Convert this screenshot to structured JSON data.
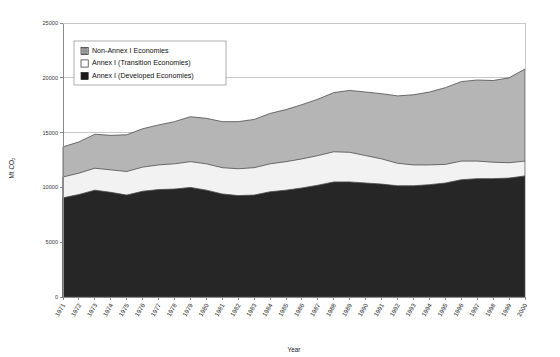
{
  "chart_data": {
    "type": "area",
    "stacked": true,
    "title": "",
    "xlabel": "Year",
    "ylabel": "Mt CO2",
    "ylabel_display": "Mt CO₂",
    "ylim": [
      0,
      25000
    ],
    "ytick_step": 5000,
    "yticks": [
      0,
      5000,
      10000,
      15000,
      20000,
      25000
    ],
    "ytick_labels": [
      "0",
      "5000",
      "10000",
      "15000",
      "20000",
      "25000"
    ],
    "grid": true,
    "grid_axis": "y",
    "legend_position": "top-left-inside",
    "x": [
      "1971",
      "1972",
      "1973",
      "1974",
      "1975",
      "1976",
      "1977",
      "1978",
      "1979",
      "1980",
      "1981",
      "1982",
      "1983",
      "1984",
      "1985",
      "1986",
      "1987",
      "1988",
      "1989",
      "1990",
      "1991",
      "1992",
      "1993",
      "1994",
      "1995",
      "1996",
      "1997",
      "1998",
      "1999",
      "2000"
    ],
    "categories": [
      "1971",
      "1972",
      "1973",
      "1974",
      "1975",
      "1976",
      "1977",
      "1978",
      "1979",
      "1980",
      "1981",
      "1982",
      "1983",
      "1984",
      "1985",
      "1986",
      "1987",
      "1988",
      "1989",
      "1990",
      "1991",
      "1992",
      "1993",
      "1994",
      "1995",
      "1996",
      "1997",
      "1998",
      "1999",
      "2000"
    ],
    "series": [
      {
        "name": "Annex I (Developed Economies)",
        "legend_label": "Annex I (Developed Economies)",
        "color": "#262626",
        "swatch": "black-square",
        "stack_order": 1,
        "values": [
          9050,
          9350,
          9750,
          9550,
          9300,
          9650,
          9800,
          9850,
          10000,
          9750,
          9400,
          9250,
          9300,
          9600,
          9750,
          9950,
          10200,
          10500,
          10500,
          10400,
          10300,
          10150,
          10150,
          10250,
          10400,
          10700,
          10800,
          10800,
          10850,
          11050
        ]
      },
      {
        "name": "Annex I (Transition Economies)",
        "legend_label": "Annex I (Transition Economies)",
        "color": "#f2f2f2",
        "swatch": "white-square",
        "stack_order": 2,
        "values": [
          1900,
          1950,
          2000,
          2050,
          2150,
          2200,
          2250,
          2300,
          2350,
          2400,
          2400,
          2450,
          2500,
          2550,
          2600,
          2650,
          2700,
          2750,
          2700,
          2500,
          2300,
          2050,
          1900,
          1800,
          1700,
          1700,
          1600,
          1500,
          1400,
          1350
        ]
      },
      {
        "name": "Non-Annex I Economies",
        "legend_label": "Non-Annex I Economies",
        "color": "#b5b5b5",
        "swatch": "gray-patterned-square",
        "stack_order": 3,
        "values": [
          2750,
          2850,
          3100,
          3150,
          3350,
          3500,
          3650,
          3850,
          4100,
          4150,
          4200,
          4300,
          4400,
          4600,
          4750,
          4950,
          5150,
          5400,
          5650,
          5800,
          5950,
          6150,
          6400,
          6650,
          7000,
          7250,
          7400,
          7450,
          7750,
          8400
        ]
      }
    ],
    "stack_totals": [
      13700,
      14150,
      14850,
      14750,
      14800,
      15350,
      15700,
      16000,
      16450,
      16300,
      16000,
      16000,
      16200,
      16750,
      17100,
      17550,
      18050,
      18650,
      18850,
      18700,
      18550,
      18350,
      18450,
      18700,
      19100,
      19650,
      19800,
      19750,
      20000,
      20800
    ]
  },
  "legend": {
    "items": [
      {
        "label": "Non-Annex I Economies",
        "swatch": "gray-patterned-square",
        "color": "#b5b5b5"
      },
      {
        "label": "Annex I (Transition Economies)",
        "swatch": "white-square",
        "color": "#ffffff"
      },
      {
        "label": "Annex I (Developed Economies)",
        "swatch": "black-square",
        "color": "#1a1a1a"
      }
    ]
  },
  "axes": {
    "y_title": "Mt CO₂",
    "x_title": "Year"
  }
}
